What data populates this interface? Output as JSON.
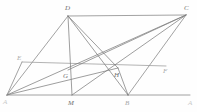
{
  "figure": {
    "type": "euclidean-plane-geometry-diagram",
    "canvas": {
      "width": 197,
      "height": 112
    },
    "stroke_color": "#8a8a8a",
    "background_color": "#fefefe",
    "points": [
      {
        "id": "A",
        "label": "A",
        "x": 7,
        "y": 95,
        "label_x": 3,
        "label_y": 104,
        "visibility": "faint"
      },
      {
        "id": "B",
        "label": "B",
        "x": 128,
        "y": 95,
        "label_x": 125,
        "label_y": 105,
        "visibility": "semifaint"
      },
      {
        "id": "C",
        "label": "C",
        "x": 186,
        "y": 15,
        "label_x": 184,
        "label_y": 10,
        "visibility": "normal"
      },
      {
        "id": "D",
        "label": "D",
        "x": 68,
        "y": 16,
        "label_x": 65,
        "label_y": 10,
        "visibility": "normal"
      },
      {
        "id": "E",
        "label": "E",
        "x": 22,
        "y": 62,
        "label_x": 17,
        "label_y": 60,
        "visibility": "semifaint"
      },
      {
        "id": "F",
        "label": "F",
        "x": 166,
        "y": 66,
        "label_x": 163,
        "label_y": 73,
        "visibility": "semifaint"
      },
      {
        "id": "G",
        "label": "G",
        "x": 68,
        "y": 70,
        "label_x": 63,
        "label_y": 78,
        "visibility": "normal"
      },
      {
        "id": "H",
        "label": "H",
        "x": 118,
        "y": 68,
        "label_x": 114,
        "label_y": 77,
        "visibility": "normal"
      },
      {
        "id": "M",
        "label": "M",
        "x": 72,
        "y": 95,
        "label_x": 68,
        "label_y": 105,
        "visibility": "normal"
      },
      {
        "id": "X",
        "label": "A",
        "x": 190,
        "y": 95,
        "label_x": 188,
        "label_y": 105,
        "visibility": "faint"
      }
    ],
    "segments": [
      {
        "id": "DC",
        "from": "D",
        "to": "C",
        "role": "parallelogram-side"
      },
      {
        "id": "AB",
        "from": "A",
        "to": "B",
        "role": "parallelogram-side"
      },
      {
        "id": "BX",
        "from": "B",
        "to": "X",
        "role": "base-extension"
      },
      {
        "id": "AD",
        "from": "A",
        "to": "D",
        "role": "parallelogram-side"
      },
      {
        "id": "BC",
        "from": "B",
        "to": "C",
        "role": "parallelogram-side"
      },
      {
        "id": "EF",
        "from": "E",
        "to": "F",
        "role": "midline"
      },
      {
        "id": "AC",
        "from": "A",
        "to": "C",
        "role": "diagonal"
      },
      {
        "id": "DB",
        "from": "D",
        "to": "B",
        "role": "diagonal"
      },
      {
        "id": "DM",
        "from": "D",
        "to": "M",
        "role": "cevian"
      },
      {
        "id": "DH",
        "from": "D",
        "to": "H",
        "role": "cevian"
      },
      {
        "id": "CG",
        "from": "C",
        "to": "G",
        "role": "cevian"
      },
      {
        "id": "CM",
        "from": "C",
        "to": "M",
        "role": "cevian"
      },
      {
        "id": "HB",
        "from": "H",
        "to": "B",
        "role": "cevian"
      },
      {
        "id": "AH",
        "from": "A",
        "to": "H",
        "role": "cevian"
      },
      {
        "id": "EA",
        "from": "E",
        "to": "A",
        "role": "side-part"
      }
    ]
  }
}
